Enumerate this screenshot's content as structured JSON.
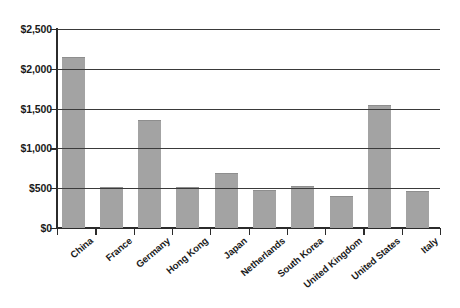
{
  "chart_data": {
    "type": "bar",
    "title": "",
    "subtitle": "",
    "xlabel": "",
    "ylabel": "",
    "categories": [
      "China",
      "France",
      "Germany",
      "Hong Kong",
      "Japan",
      "Netherlands",
      "South Korea",
      "United Kingdom",
      "United States",
      "Italy"
    ],
    "values": [
      2143,
      515,
      1360,
      510,
      690,
      480,
      522,
      405,
      1540,
      468
    ],
    "series": [
      {
        "name": "",
        "values": [
          2143,
          515,
          1360,
          510,
          690,
          480,
          522,
          405,
          1540,
          468
        ]
      }
    ],
    "ylim": [
      0,
      2500
    ],
    "yticks": [
      0,
      500,
      1000,
      1500,
      2000,
      2500
    ],
    "ytick_labels": [
      "$0",
      "$500",
      "$1,000",
      "$1,500",
      "$2,000",
      "$2,500"
    ],
    "grid": true,
    "grid_axis": "y",
    "legend": false,
    "legend_position": "none",
    "bar_color": "#a3a3a3",
    "axis_color": "#2b2b2b",
    "grid_color": "#3a3a3a",
    "background_color": "#ffffff",
    "x_label_rotation": -40,
    "value_prefix": "$",
    "annotations": []
  }
}
